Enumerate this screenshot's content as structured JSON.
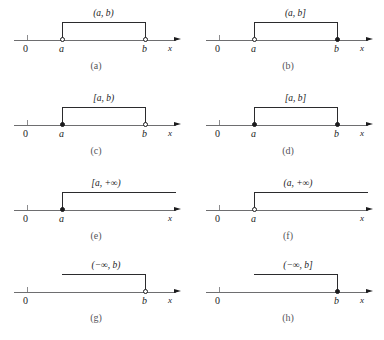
{
  "figure": {
    "background_color": "#ffffff",
    "axis_color": "#6e6e70",
    "ink_color": "#1b1b1d",
    "bracket_color": "#2b2b2d",
    "axis_variable": "x",
    "origin_label": "0"
  },
  "panels": [
    {
      "caption": "(a)",
      "interval": "(a, b)",
      "left_label": "a",
      "right_label": "b",
      "left_point": "open",
      "right_point": "open",
      "shape": "segment"
    },
    {
      "caption": "(b)",
      "interval": "(a, b]",
      "left_label": "a",
      "right_label": "b",
      "left_point": "open",
      "right_point": "closed",
      "shape": "segment"
    },
    {
      "caption": "(c)",
      "interval": "[a, b)",
      "left_label": "a",
      "right_label": "b",
      "left_point": "closed",
      "right_point": "open",
      "shape": "segment"
    },
    {
      "caption": "(d)",
      "interval": "[a, b]",
      "left_label": "a",
      "right_label": "b",
      "left_point": "closed",
      "right_point": "closed",
      "shape": "segment"
    },
    {
      "caption": "(e)",
      "interval": "[a, +∞)",
      "left_label": "a",
      "right_label": "",
      "left_point": "closed",
      "right_point": "none",
      "shape": "ray-right"
    },
    {
      "caption": "(f)",
      "interval": "(a, +∞)",
      "left_label": "a",
      "right_label": "",
      "left_point": "open",
      "right_point": "none",
      "shape": "ray-right"
    },
    {
      "caption": "(g)",
      "interval": "(−∞, b)",
      "left_label": "",
      "right_label": "b",
      "left_point": "none",
      "right_point": "open",
      "shape": "ray-left"
    },
    {
      "caption": "(h)",
      "interval": "(−∞, b]",
      "left_label": "",
      "right_label": "b",
      "left_point": "none",
      "right_point": "closed",
      "shape": "ray-left"
    }
  ]
}
